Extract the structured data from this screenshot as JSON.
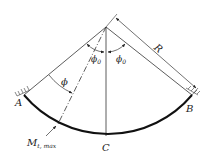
{
  "diagram": {
    "labels": {
      "A": "A",
      "B": "B",
      "C": "C",
      "R": "R",
      "phi": "ϕ",
      "phi0_left": "ϕ",
      "phi0_right": "ϕ",
      "phi0_sub": "0",
      "moment_main": "M",
      "moment_sub": "t, max"
    },
    "colors": {
      "line": "#222222",
      "arc": "#111111",
      "hatch": "#555555"
    }
  }
}
